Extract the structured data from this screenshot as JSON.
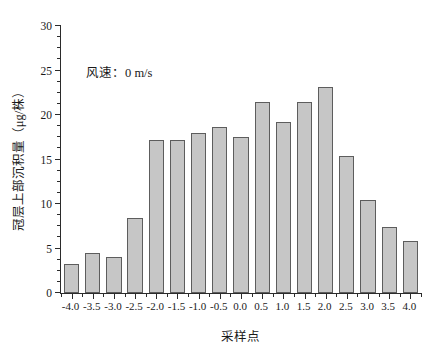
{
  "chart_data": {
    "type": "bar",
    "title": "",
    "xlabel": "采样点",
    "ylabel": "冠层上部沉积量（μg/株）",
    "categories": [
      "-4.0",
      "-3.5",
      "-3.0",
      "-2.5",
      "-2.0",
      "-1.5",
      "-1.0",
      "-0.5",
      "0.0",
      "0.5",
      "1.0",
      "1.5",
      "2.0",
      "2.5",
      "3.0",
      "3.5",
      "4.0"
    ],
    "values": [
      3.3,
      4.5,
      4.1,
      8.4,
      17.2,
      17.2,
      18.0,
      18.6,
      17.5,
      21.5,
      19.2,
      21.5,
      23.1,
      15.4,
      10.4,
      7.4,
      5.9
    ],
    "ylim": [
      0,
      30
    ],
    "ytick_values": [
      0,
      5,
      10,
      15,
      20,
      25,
      30
    ],
    "ytick_labels": [
      "0",
      "5",
      "10",
      "15",
      "20",
      "25",
      "30"
    ],
    "yminor_step": 1.25,
    "grid": false,
    "legend": "none",
    "annotations": [
      {
        "text": "风速：0 m/s",
        "x": -3.4,
        "y": 25.0
      }
    ],
    "bar_fill_color": "#c6c6c6",
    "bar_edge_color": "#5d5d5d",
    "axis_color": "#2b2b2b"
  },
  "axes": {
    "y_title": "冠层上部沉积量（μg/株）",
    "x_title": "采样点"
  },
  "annotation": {
    "wind_speed_label": "风速：0 m/s"
  }
}
